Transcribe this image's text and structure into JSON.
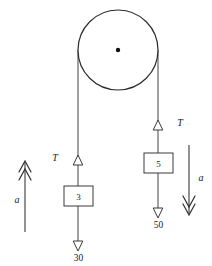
{
  "diagram": {
    "colors": {
      "stroke": "#3a3a3a",
      "rope": "#555555",
      "pulley_rim": "#2b2b2b",
      "hub": "#111111",
      "text": "#1a1a1a",
      "background": "#ffffff"
    },
    "pulley": {
      "name": "pulley",
      "cx": 118,
      "cy": 50,
      "r": 40,
      "hub_r": 2.2
    },
    "left_side": {
      "rope_x": 78,
      "tension_label": "T",
      "block_label": "3",
      "weight_label": "30",
      "accel_label": "a",
      "accel_direction": "up"
    },
    "right_side": {
      "rope_x": 158,
      "tension_label": "T",
      "block_label": "5",
      "weight_label": "50",
      "accel_label": "a",
      "accel_direction": "down"
    }
  }
}
